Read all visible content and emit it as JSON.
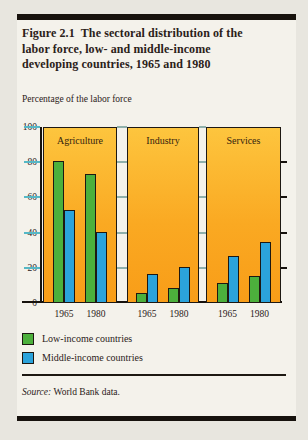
{
  "figure": {
    "title_lines": [
      "Figure 2.1  The sectoral distribution of the",
      "labor force, low- and middle-income",
      "developing countries, 1965 and 1980"
    ],
    "subtitle": "Percentage of the labor force",
    "source_label": "Source:",
    "source_text": "World Bank data."
  },
  "legend": {
    "items": [
      {
        "label": "Low-income countries",
        "color": "#4cb03c"
      },
      {
        "label": "Middle-income countries",
        "color": "#2ba3db"
      }
    ]
  },
  "chart_data": {
    "type": "bar",
    "title": "Figure 2.1 The sectoral distribution of the labor force, low- and middle-income developing countries, 1965 and 1980",
    "ylabel": "Percentage of the labor force",
    "ylim": [
      0,
      100
    ],
    "yticks": [
      0,
      20,
      40,
      60,
      80,
      100
    ],
    "categories": [
      "1965",
      "1980"
    ],
    "panels": [
      {
        "label": "Agriculture",
        "years": [
          "1965",
          "1980"
        ],
        "series": [
          {
            "name": "Low-income countries",
            "values": [
              80,
              73
            ]
          },
          {
            "name": "Middle-income countries",
            "values": [
              52,
              40
            ]
          }
        ]
      },
      {
        "label": "Industry",
        "years": [
          "1965",
          "1980"
        ],
        "series": [
          {
            "name": "Low-income countries",
            "values": [
              5,
              8
            ]
          },
          {
            "name": "Middle-income countries",
            "values": [
              16,
              20
            ]
          }
        ]
      },
      {
        "label": "Services",
        "years": [
          "1965",
          "1980"
        ],
        "series": [
          {
            "name": "Low-income countries",
            "values": [
              11,
              15
            ]
          },
          {
            "name": "Middle-income countries",
            "values": [
              26,
              34
            ]
          }
        ]
      }
    ],
    "colors": {
      "low_income": "#4cb03c",
      "middle_income": "#2ba3db",
      "panel_top": "#fdc53e",
      "panel_bottom": "#f89d18",
      "tick": "#56b8c5",
      "gap_tick": "#8fb0ab",
      "ink": "#17120d"
    },
    "legend_position": "bottom-left",
    "grid": false,
    "source": "World Bank data."
  }
}
